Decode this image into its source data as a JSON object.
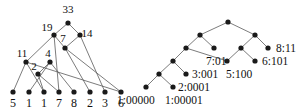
{
  "figure": {
    "background_color": "#ffffff",
    "node_color": "#1a1a1a",
    "edge_color": "#5a5a5a"
  },
  "left_graph": {
    "name": "weighted-merge-tree",
    "internal_nodes": [
      {
        "id": "n33",
        "label": "33",
        "x": 68,
        "y": 23,
        "label_x": 68,
        "label_y": 13
      },
      {
        "id": "n19",
        "label": "19",
        "x": 54,
        "y": 35,
        "label_x": 47,
        "label_y": 31
      },
      {
        "id": "n14",
        "label": "14",
        "x": 80,
        "y": 35,
        "label_x": 87,
        "label_y": 37
      },
      {
        "id": "n7",
        "label": "7",
        "x": 65,
        "y": 48,
        "label_x": 63,
        "label_y": 42
      },
      {
        "id": "n11",
        "label": "11",
        "x": 26,
        "y": 62,
        "label_x": 22,
        "label_y": 57
      },
      {
        "id": "n4",
        "label": "4",
        "x": 50,
        "y": 62,
        "label_x": 48,
        "label_y": 57
      },
      {
        "id": "n2",
        "label": "2",
        "x": 38,
        "y": 74,
        "label_x": 34,
        "label_y": 70
      }
    ],
    "leaves": [
      {
        "id": "l5",
        "label": "5",
        "x": 13,
        "y": 92
      },
      {
        "id": "l1a",
        "label": "1",
        "x": 29,
        "y": 92
      },
      {
        "id": "l1b",
        "label": "1",
        "x": 44,
        "y": 92
      },
      {
        "id": "l7",
        "label": "7",
        "x": 59,
        "y": 92
      },
      {
        "id": "l8",
        "label": "8",
        "x": 74,
        "y": 92
      },
      {
        "id": "l2",
        "label": "2",
        "x": 90,
        "y": 92
      },
      {
        "id": "l3",
        "label": "3",
        "x": 105,
        "y": 92
      },
      {
        "id": "l6",
        "label": "6",
        "x": 121,
        "y": 92
      }
    ],
    "leaf_label_y": 107,
    "edges": [
      [
        "n33",
        "n19"
      ],
      [
        "n33",
        "n14"
      ],
      [
        "n19",
        "n11"
      ],
      [
        "n19",
        "n7"
      ],
      [
        "n14",
        "n7"
      ],
      [
        "n14",
        "l3"
      ],
      [
        "n7",
        "l2"
      ],
      [
        "n7",
        "l6"
      ],
      [
        "n11",
        "l5"
      ],
      [
        "n11",
        "l1b"
      ],
      [
        "n4",
        "l1a"
      ],
      [
        "n4",
        "l8"
      ],
      [
        "n2",
        "l1b"
      ],
      [
        "n2",
        "l7"
      ],
      [
        "n19",
        "l7"
      ],
      [
        "n4",
        "n2"
      ],
      [
        "n11",
        "l6"
      ]
    ]
  },
  "right_graph": {
    "name": "binary-code-tree",
    "nodes": [
      {
        "id": "r-root",
        "x": 228,
        "y": 22
      },
      {
        "id": "r-l1",
        "x": 200,
        "y": 35
      },
      {
        "id": "r-r1",
        "x": 255,
        "y": 35
      },
      {
        "id": "r-l2",
        "x": 186,
        "y": 48
      },
      {
        "id": "r-m2",
        "x": 214,
        "y": 48
      },
      {
        "id": "r-r2",
        "x": 241,
        "y": 48
      },
      {
        "id": "r-r2b",
        "x": 268,
        "y": 48
      },
      {
        "id": "r-l3",
        "x": 173,
        "y": 61
      },
      {
        "id": "r-m3",
        "x": 227,
        "y": 61
      },
      {
        "id": "r-r3",
        "x": 255,
        "y": 61
      },
      {
        "id": "r-l4",
        "x": 159,
        "y": 74
      },
      {
        "id": "r-m4",
        "x": 186,
        "y": 74
      },
      {
        "id": "r-l5",
        "x": 146,
        "y": 87
      },
      {
        "id": "r-m5",
        "x": 173,
        "y": 87
      }
    ],
    "edges": [
      [
        "r-root",
        "r-l1"
      ],
      [
        "r-root",
        "r-r1"
      ],
      [
        "r-l1",
        "r-l2"
      ],
      [
        "r-l1",
        "r-m2"
      ],
      [
        "r-r1",
        "r-r2"
      ],
      [
        "r-r1",
        "r-r2b"
      ],
      [
        "r-l2",
        "r-l3"
      ],
      [
        "r-l2",
        "r-m3"
      ],
      [
        "r-r2",
        "r-m3"
      ],
      [
        "r-r2",
        "r-r3"
      ],
      [
        "r-l3",
        "r-l4"
      ],
      [
        "r-l3",
        "r-m4"
      ],
      [
        "r-l4",
        "r-l5"
      ],
      [
        "r-l4",
        "r-m5"
      ]
    ],
    "labels": [
      {
        "id": "lab-8",
        "text": "8:11",
        "x": 276,
        "y": 52,
        "anchor": "start"
      },
      {
        "id": "lab-6",
        "text": "6:101",
        "x": 262,
        "y": 65,
        "anchor": "start"
      },
      {
        "id": "lab-7",
        "text": "7:01",
        "x": 206,
        "y": 65,
        "anchor": "start"
      },
      {
        "id": "lab-3",
        "text": "3:001",
        "x": 192,
        "y": 78,
        "anchor": "start"
      },
      {
        "id": "lab-5",
        "text": "5:100",
        "x": 226,
        "y": 78,
        "anchor": "start"
      },
      {
        "id": "lab-2",
        "text": "2:0001",
        "x": 178,
        "y": 91,
        "anchor": "start"
      },
      {
        "id": "lab-1a",
        "text": "1:00000",
        "x": 117,
        "y": 104,
        "anchor": "start"
      },
      {
        "id": "lab-1b",
        "text": "1:00001",
        "x": 165,
        "y": 104,
        "anchor": "start"
      }
    ]
  }
}
